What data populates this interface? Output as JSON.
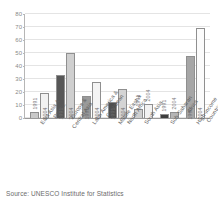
{
  "figure": {
    "source_note": "Source: UNESCO Institute for Statistics",
    "top_ghost_left": "",
    "top_ghost_right": ""
  },
  "chart_data": {
    "type": "bar",
    "title": "",
    "subtitle": "",
    "xlabel": "",
    "ylabel": "",
    "ylim": [
      0,
      80
    ],
    "yticks": [
      0,
      10,
      20,
      30,
      40,
      50,
      60,
      70,
      80
    ],
    "ytick_labels": [
      "0",
      "10",
      "20",
      "30",
      "40",
      "50",
      "60",
      "70",
      "80"
    ],
    "grid": true,
    "legend": "none",
    "series_labels_on_bars": true,
    "categories": [
      "East Asia & Pacific",
      "Europe & Central Asia",
      "Latin America & Caribbean",
      "Middle East & North Africa",
      "South Asia",
      "Sub-Saharan Africa",
      "High-income Countries"
    ],
    "category_lines": [
      [
        "East Asia &",
        "Pacific"
      ],
      [
        "Europe &",
        "Central Asia"
      ],
      [
        "Latin America &",
        "Caribbean"
      ],
      [
        "Middle East &",
        "North Africa"
      ],
      [
        "South Asia"
      ],
      [
        "Sub-Saharan",
        "Africa"
      ],
      [
        "High-income",
        "Countries"
      ]
    ],
    "series": [
      {
        "name": "1991",
        "color": "#a8a8a8",
        "values": [
          5,
          33,
          17,
          12,
          7,
          3,
          48
        ]
      },
      {
        "name": "2004",
        "color": "#e8e8e8",
        "values": [
          19,
          50,
          28,
          22,
          11,
          5,
          69
        ]
      }
    ],
    "bar_styles": [
      {
        "1991": "#c9c9c9",
        "2004": "#f2f2f2"
      },
      {
        "1991": "#575757",
        "2004": "#cfcfcf"
      },
      {
        "1991": "#9a9a9a",
        "2004": "#f4f4f4"
      },
      {
        "1991": "#4f4f4f",
        "2004": "#d4d4d4"
      },
      {
        "1991": "#cfcfcf",
        "2004": "#f2f2f2"
      },
      {
        "1991": "#3d3d3d",
        "2004": "#b5b5b5"
      },
      {
        "1991": "#a6a6a6",
        "2004": "#fbfbfb"
      }
    ]
  }
}
